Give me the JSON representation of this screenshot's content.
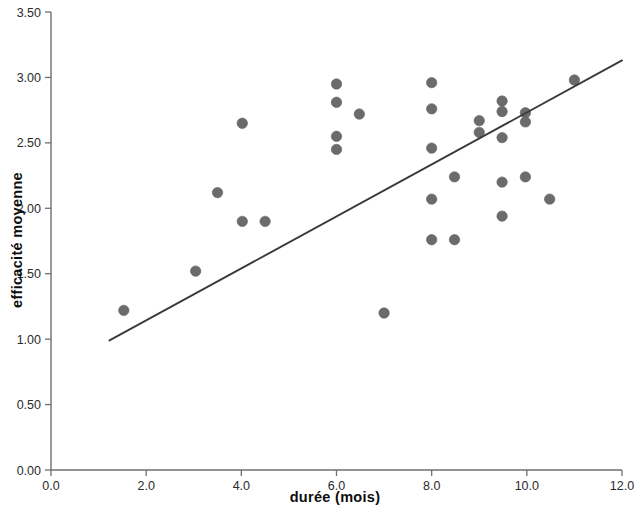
{
  "chart_data": {
    "type": "scatter",
    "title": "",
    "xlabel": "durée (mois)",
    "ylabel": "efficacité moyenne",
    "xlim": [
      0.0,
      12.0
    ],
    "ylim": [
      0.0,
      3.5
    ],
    "x_ticks": [
      "0.0",
      "2.0",
      "4.0",
      "6.0",
      "8.0",
      "10.0",
      "12.0"
    ],
    "x_tick_values": [
      0.0,
      2.0,
      4.0,
      6.0,
      8.0,
      10.0,
      12.0
    ],
    "y_ticks": [
      "0.00",
      "0.50",
      "1.00",
      "1.50",
      "2.00",
      "2.50",
      "3.00",
      "3.50"
    ],
    "y_tick_values": [
      0.0,
      0.5,
      1.0,
      1.5,
      2.0,
      2.5,
      3.0,
      3.5
    ],
    "grid": false,
    "legend": false,
    "marker_color": "#6b6b6b",
    "line_color": "#3a3a3a",
    "axis_color": "#6f6f6f",
    "points": [
      {
        "x": 1.53,
        "y": 1.22
      },
      {
        "x": 3.04,
        "y": 1.52
      },
      {
        "x": 3.5,
        "y": 2.12
      },
      {
        "x": 4.02,
        "y": 2.65
      },
      {
        "x": 4.02,
        "y": 1.9
      },
      {
        "x": 4.5,
        "y": 1.9
      },
      {
        "x": 6.0,
        "y": 2.95
      },
      {
        "x": 6.0,
        "y": 2.81
      },
      {
        "x": 6.0,
        "y": 2.55
      },
      {
        "x": 6.0,
        "y": 2.45
      },
      {
        "x": 6.48,
        "y": 2.72
      },
      {
        "x": 7.0,
        "y": 1.2
      },
      {
        "x": 8.0,
        "y": 2.96
      },
      {
        "x": 8.0,
        "y": 2.76
      },
      {
        "x": 8.0,
        "y": 2.46
      },
      {
        "x": 8.0,
        "y": 2.07
      },
      {
        "x": 8.0,
        "y": 1.76
      },
      {
        "x": 8.48,
        "y": 2.24
      },
      {
        "x": 8.48,
        "y": 1.76
      },
      {
        "x": 9.0,
        "y": 2.67
      },
      {
        "x": 9.0,
        "y": 2.58
      },
      {
        "x": 9.48,
        "y": 2.82
      },
      {
        "x": 9.48,
        "y": 2.74
      },
      {
        "x": 9.48,
        "y": 2.54
      },
      {
        "x": 9.48,
        "y": 2.2
      },
      {
        "x": 9.48,
        "y": 1.94
      },
      {
        "x": 9.97,
        "y": 2.73
      },
      {
        "x": 9.97,
        "y": 2.66
      },
      {
        "x": 9.97,
        "y": 2.24
      },
      {
        "x": 10.48,
        "y": 2.07
      },
      {
        "x": 11.0,
        "y": 2.98
      }
    ],
    "fit_line": {
      "x_start": 1.23,
      "y_start": 0.99,
      "x_end": 12.0,
      "y_end": 3.13
    }
  }
}
